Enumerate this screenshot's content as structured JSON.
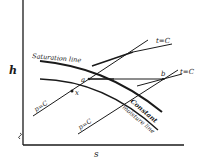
{
  "diagram": {
    "axes": {
      "y_label": "h",
      "x_label": "s"
    },
    "curves": {
      "saturation_line": "Saturation line",
      "constant_moisture_line_1": "Constant",
      "constant_moisture_line_2": "moisture line",
      "pressure_line_1": "p=C",
      "pressure_line_2": "p=C",
      "temperature_line_1": "t=C",
      "temperature_line_2": "t=C"
    },
    "points": {
      "a": "a",
      "x": "x",
      "b": "b"
    },
    "colors": {
      "ink": "#1a1a1a",
      "background": "#ffffff"
    }
  }
}
